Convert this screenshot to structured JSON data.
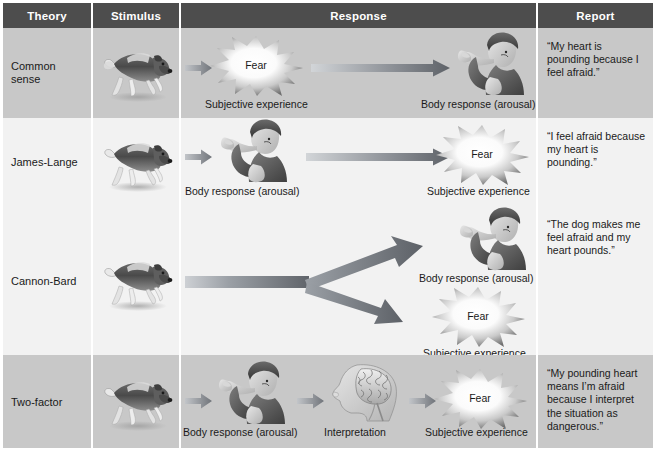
{
  "figure": {
    "kind": "emotion-theories-comparison-table",
    "columns": [
      {
        "id": "theory",
        "label": "Theory"
      },
      {
        "id": "stimulus",
        "label": "Stimulus"
      },
      {
        "id": "response",
        "label": "Response"
      },
      {
        "id": "report",
        "label": "Report"
      }
    ],
    "rows": [
      {
        "theory": "Common\nsense",
        "theory_line1": "Common",
        "theory_line2": "sense",
        "stimulus_icon": "running-dog-icon",
        "shade": "dark",
        "response_steps": [
          {
            "icon": "starburst-fear-icon",
            "burst_text": "Fear",
            "caption": "Subjective experience"
          },
          {
            "icon": "frightened-person-icon",
            "caption": "Body response (arousal)"
          }
        ],
        "report": "“My heart is pounding because I feel afraid.”"
      },
      {
        "theory": "James-Lange",
        "theory_line1": "James-Lange",
        "theory_line2": "",
        "stimulus_icon": "running-dog-icon",
        "shade": "light",
        "response_steps": [
          {
            "icon": "frightened-person-icon",
            "caption": "Body response (arousal)"
          },
          {
            "icon": "starburst-fear-icon",
            "burst_text": "Fear",
            "caption": "Subjective experience"
          }
        ],
        "report": "“I feel afraid because my heart is pounding.”"
      },
      {
        "theory": "Cannon-Bard",
        "theory_line1": "Cannon-Bard",
        "theory_line2": "",
        "stimulus_icon": "running-dog-icon",
        "shade": "light",
        "response_steps": [
          {
            "icon": "frightened-person-icon",
            "caption": "Body response (arousal)"
          },
          {
            "icon": "starburst-fear-icon",
            "burst_text": "Fear",
            "caption": "Subjective experience"
          }
        ],
        "report": "“The dog makes me feel afraid and my heart pounds.”"
      },
      {
        "theory": "Two-factor",
        "theory_line1": "Two-factor",
        "theory_line2": "",
        "stimulus_icon": "running-dog-icon",
        "shade": "dark",
        "response_steps": [
          {
            "icon": "frightened-person-icon",
            "caption": "Body response (arousal)"
          },
          {
            "icon": "brain-head-profile-icon",
            "caption": "Interpretation"
          },
          {
            "icon": "starburst-fear-icon",
            "burst_text": "Fear",
            "caption": "Subjective experience"
          }
        ],
        "report": "“My pounding heart means I’m afraid because I interpret the situation as dangerous.”"
      }
    ],
    "captions": {
      "subjective_experience": "Subjective experience",
      "body_response": "Body response (arousal)",
      "interpretation": "Interpretation",
      "fear": "Fear"
    },
    "colors": {
      "header_bg": "#4d4d4d",
      "header_text": "#ffffff",
      "row_dark": "#c8c8c8",
      "row_light": "#f2f2f2",
      "text": "#1a1a1a",
      "arrow_dark": "#6e7176",
      "arrow_light": "#b9bcc0",
      "page_bg": "#ffffff"
    }
  }
}
